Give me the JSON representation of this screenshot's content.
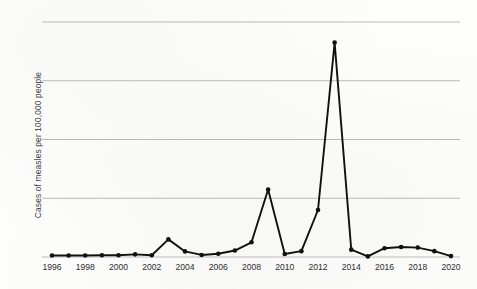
{
  "chart_data": {
    "type": "line",
    "title": "",
    "xlabel": "",
    "ylabel": "Cases of measles per 100,000 people",
    "x": [
      1996,
      1997,
      1998,
      1999,
      2000,
      2001,
      2002,
      2003,
      2004,
      2005,
      2006,
      2007,
      2008,
      2009,
      2010,
      2011,
      2012,
      2013,
      2014,
      2015,
      2016,
      2017,
      2018,
      2019,
      2020
    ],
    "values": [
      0.5,
      0.5,
      0.5,
      0.6,
      0.6,
      0.9,
      0.6,
      6.0,
      1.9,
      0.7,
      1.1,
      2.2,
      5.0,
      23.0,
      1.0,
      2.0,
      16.0,
      73.0,
      2.5,
      0.2,
      3.0,
      3.4,
      3.2,
      2.0,
      0.3
    ],
    "series": [
      {
        "name": "Cases of measles per 100,000 people",
        "values": [
          0.5,
          0.5,
          0.5,
          0.6,
          0.6,
          0.9,
          0.6,
          6.0,
          1.9,
          0.7,
          1.1,
          2.2,
          5.0,
          23.0,
          1.0,
          2.0,
          16.0,
          73.0,
          2.5,
          0.2,
          3.0,
          3.4,
          3.2,
          2.0,
          0.3
        ]
      }
    ],
    "xtick_labels": [
      "1996",
      "1998",
      "2000",
      "2002",
      "2004",
      "2006",
      "2008",
      "2010",
      "2012",
      "2014",
      "2016",
      "2018",
      "2020"
    ],
    "ytick_labels": [],
    "xlim": [
      1996,
      2020
    ],
    "ylim": [
      0,
      80
    ],
    "gridlines_y": [
      20,
      40,
      60,
      80
    ],
    "grid": "horizontal-only",
    "legend": "none",
    "marker": "filled-circle",
    "line_color": "#111111",
    "grid_color": "#b9b9b9",
    "background_color": "#fdfdfc"
  }
}
